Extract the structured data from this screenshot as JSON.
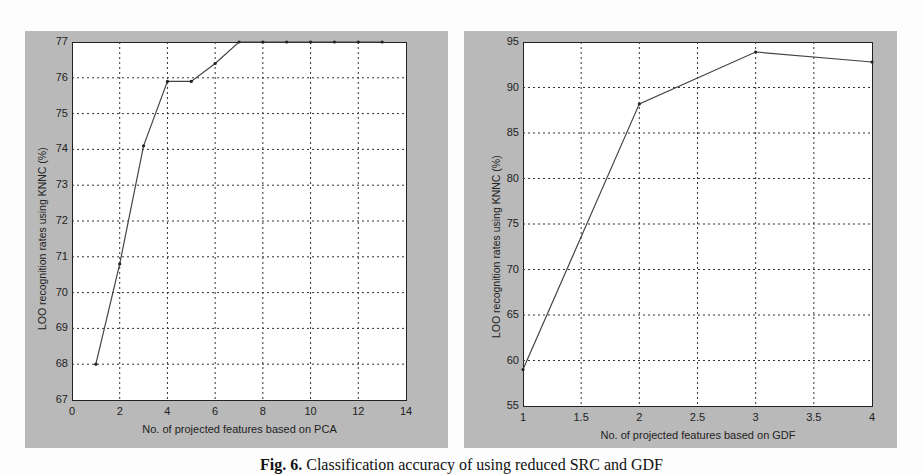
{
  "caption": {
    "label": "Fig. 6.",
    "text": "Classification accuracy of using reduced SRC and GDF"
  },
  "chart_data": [
    {
      "type": "line",
      "title": "",
      "xlabel": "No. of projected features based on PCA",
      "ylabel": "LOO recognition rates using KNNC (%)",
      "xlim": [
        0,
        14
      ],
      "ylim": [
        67,
        77
      ],
      "xticks": [
        0,
        2,
        4,
        6,
        8,
        10,
        12,
        14
      ],
      "yticks": [
        67,
        68,
        69,
        70,
        71,
        72,
        73,
        74,
        75,
        76,
        77
      ],
      "grid": true,
      "x": [
        1,
        2,
        3,
        4,
        5,
        6,
        7,
        8,
        9,
        10,
        11,
        12,
        13
      ],
      "values": [
        68.0,
        70.8,
        74.1,
        75.9,
        75.9,
        76.4,
        77.0,
        77.0,
        77.0,
        77.0,
        77.0,
        77.0,
        77.0
      ],
      "line_color": "#444444"
    },
    {
      "type": "line",
      "title": "",
      "xlabel": "No. of projected features based on GDF",
      "ylabel": "LOO recognition rates using KNNC (%)",
      "xlim": [
        1,
        4
      ],
      "ylim": [
        55,
        95
      ],
      "xticks": [
        1,
        1.5,
        2,
        2.5,
        3,
        3.5,
        4
      ],
      "yticks": [
        55,
        60,
        65,
        70,
        75,
        80,
        85,
        90,
        95
      ],
      "grid": true,
      "x": [
        1,
        2,
        3,
        4
      ],
      "values": [
        59.0,
        88.2,
        93.9,
        92.8
      ],
      "line_color": "#444444"
    }
  ],
  "colors": {
    "panel_bg": "#b9b9b9",
    "plot_bg": "#ffffff",
    "grid": "#333333",
    "line": "#444444"
  }
}
